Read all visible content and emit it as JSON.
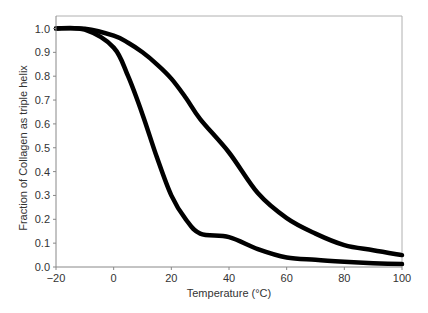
{
  "chart_data": {
    "type": "line",
    "title": "",
    "xlabel": "Temperature (°C)",
    "ylabel": "Fraction of Collagen as triple helix",
    "xlim": [
      -20,
      100
    ],
    "ylim": [
      0.0,
      1.0
    ],
    "xticks": [
      -20,
      0,
      20,
      40,
      60,
      80,
      100
    ],
    "xtick_labels": [
      "−20",
      "0",
      "20",
      "40",
      "60",
      "80",
      "100"
    ],
    "yticks": [
      0.0,
      0.1,
      0.2,
      0.3,
      0.4,
      0.5,
      0.6,
      0.7,
      0.8,
      0.9,
      1.0
    ],
    "ytick_labels": [
      "0.0",
      "0.1",
      "0.2",
      "0.3",
      "0.4",
      "0.5",
      "0.6",
      "0.7",
      "0.8",
      "0.9",
      "1.0"
    ],
    "grid": false,
    "legend": null,
    "x": [
      -20,
      -10,
      0,
      5,
      10,
      15,
      20,
      25,
      30,
      40,
      50,
      60,
      70,
      80,
      90,
      100
    ],
    "series": [
      {
        "name": "lower-stability curve",
        "values": [
          1.0,
          0.995,
          0.92,
          0.8,
          0.64,
          0.46,
          0.3,
          0.2,
          0.14,
          0.125,
          0.075,
          0.04,
          0.03,
          0.022,
          0.016,
          0.012
        ],
        "color": "#000000"
      },
      {
        "name": "higher-stability curve",
        "values": [
          1.0,
          0.999,
          0.97,
          0.94,
          0.9,
          0.85,
          0.79,
          0.71,
          0.62,
          0.48,
          0.31,
          0.205,
          0.14,
          0.092,
          0.07,
          0.05
        ],
        "color": "#000000"
      }
    ]
  }
}
